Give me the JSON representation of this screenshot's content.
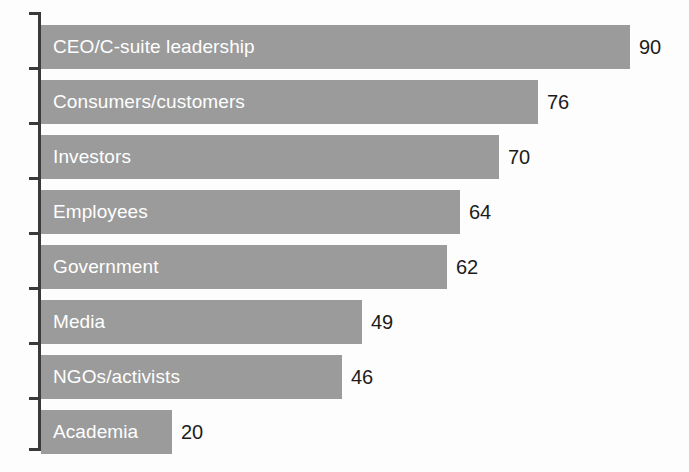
{
  "chart_data": {
    "type": "bar",
    "orientation": "horizontal",
    "title": "",
    "subtitle": "",
    "xlabel": "",
    "ylabel": "",
    "xlim": [
      0,
      90
    ],
    "grid": false,
    "legend": null,
    "categories": [
      "CEO/C-suite leadership",
      "Consumers/customers",
      "Investors",
      "Employees",
      "Government",
      "Media",
      "NGOs/activists",
      "Academia"
    ],
    "values": [
      90,
      76,
      70,
      64,
      62,
      49,
      46,
      20
    ],
    "value_labels": [
      "90",
      "76",
      "70",
      "64",
      "62",
      "49",
      "46",
      "20"
    ],
    "bars": [
      {
        "category": "CEO/C-suite leadership",
        "value": 90,
        "value_label": "90"
      },
      {
        "category": "Consumers/customers",
        "value": 76,
        "value_label": "76"
      },
      {
        "category": "Investors",
        "value": 70,
        "value_label": "70"
      },
      {
        "category": "Employees",
        "value": 64,
        "value_label": "64"
      },
      {
        "category": "Government",
        "value": 62,
        "value_label": "62"
      },
      {
        "category": "Media",
        "value": 49,
        "value_label": "49"
      },
      {
        "category": "NGOs/activists",
        "value": 46,
        "value_label": "46"
      },
      {
        "category": "Academia",
        "value": 20,
        "value_label": "20"
      }
    ],
    "colors": {
      "bar_fill": "#9b9b9b",
      "bar_label_text": "#ffffff",
      "value_label_text": "#1c1c1c",
      "axis_line": "#3a3a3a",
      "background": "#fdfdfd"
    }
  }
}
